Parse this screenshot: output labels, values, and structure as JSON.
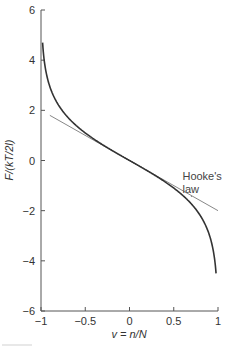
{
  "chart_data": {
    "type": "line",
    "title": "",
    "xlabel": "v = n/N",
    "ylabel": "F/(kT/2l)",
    "xlim": [
      -1,
      1
    ],
    "ylim": [
      -6,
      6
    ],
    "x_ticks": [
      -1,
      -0.5,
      0,
      0.5,
      1
    ],
    "x_tick_labels": [
      "−1",
      "−0.5",
      "0",
      "0.5",
      "1"
    ],
    "y_ticks": [
      -6,
      -4,
      -2,
      0,
      2,
      4,
      6
    ],
    "y_tick_labels": [
      "−6",
      "−4",
      "−2",
      "0",
      "2",
      "4",
      "6"
    ],
    "grid": false,
    "legend": null,
    "series": [
      {
        "name": "exact force",
        "color": "#333333",
        "description": "F/(kT/2l) = ln((1−v)/(1+v))",
        "x": [
          -0.98,
          -0.95,
          -0.9,
          -0.8,
          -0.7,
          -0.6,
          -0.5,
          -0.4,
          -0.3,
          -0.2,
          -0.1,
          0,
          0.1,
          0.2,
          0.3,
          0.4,
          0.5,
          0.6,
          0.7,
          0.8,
          0.9,
          0.95,
          0.98
        ],
        "y": [
          4.6,
          3.66,
          2.94,
          2.2,
          1.73,
          1.39,
          1.1,
          0.85,
          0.62,
          0.41,
          0.2,
          0,
          -0.2,
          -0.41,
          -0.62,
          -0.85,
          -1.1,
          -1.39,
          -1.73,
          -2.2,
          -2.94,
          -3.66,
          -4.6
        ]
      },
      {
        "name": "Hooke's law",
        "color": "#888888",
        "description": "linear approximation F/(kT/2l) = −2v",
        "x": [
          -0.9,
          1.0
        ],
        "y": [
          1.8,
          -2.0
        ]
      }
    ],
    "annotations": [
      {
        "text_line1": "Hooke's",
        "text_line2": "law",
        "x": 0.7,
        "y": 1.6,
        "pointer_to": [
          0.7,
          -1.4
        ]
      }
    ]
  },
  "labels": {
    "xlabel": "v = n/N",
    "ylabel": "F/(kT/2l)",
    "annotation_line1": "Hooke's",
    "annotation_line2": "law"
  }
}
